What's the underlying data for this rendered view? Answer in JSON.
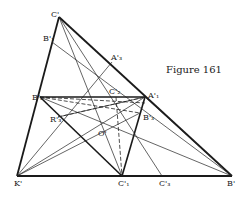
{
  "caption": "Figure 161",
  "points": {
    "C": {
      "label": "C'",
      "x": 59,
      "y": 17
    },
    "K": {
      "label": "K'",
      "x": 17,
      "y": 176
    },
    "B": {
      "label": "B'",
      "x": 232,
      "y": 176
    },
    "B2": {
      "label": "B'₂",
      "x": 40,
      "y": 97
    },
    "A1": {
      "label": "A'₁",
      "x": 145,
      "y": 97
    },
    "C1": {
      "label": "C'₁",
      "x": 122,
      "y": 176
    },
    "B1": {
      "label": "B'₁",
      "x": 52,
      "y": 42
    },
    "A3": {
      "label": "A'₃",
      "x": 112,
      "y": 62
    },
    "C2": {
      "label": "C'₂",
      "x": 116,
      "y": 97
    },
    "C3": {
      "label": "C'₃",
      "x": 162,
      "y": 176
    },
    "B3": {
      "label": "B'₃",
      "x": 140,
      "y": 113
    },
    "R3": {
      "label": "R'₃",
      "x": 58,
      "y": 117
    },
    "O": {
      "label": "O'",
      "x": 104,
      "y": 128
    }
  },
  "labels": [
    {
      "id": "C",
      "text": "C'",
      "x": 51,
      "y": 11
    },
    {
      "id": "B1",
      "text": "B'₁",
      "x": 43,
      "y": 35
    },
    {
      "id": "A3",
      "text": "A'₃",
      "x": 111,
      "y": 54
    },
    {
      "id": "B2",
      "text": "B'₂",
      "x": 32,
      "y": 94
    },
    {
      "id": "C2",
      "text": "C'₂",
      "x": 109,
      "y": 88
    },
    {
      "id": "A1",
      "text": "A'₁",
      "x": 148,
      "y": 92
    },
    {
      "id": "R3",
      "text": "R'₃",
      "x": 50,
      "y": 116
    },
    {
      "id": "B3",
      "text": "B'₃",
      "x": 143,
      "y": 114
    },
    {
      "id": "O",
      "text": "O'",
      "x": 98,
      "y": 130
    },
    {
      "id": "K",
      "text": "K'",
      "x": 14,
      "y": 180
    },
    {
      "id": "C1",
      "text": "C'₁",
      "x": 118,
      "y": 180
    },
    {
      "id": "C3",
      "text": "C'₃",
      "x": 159,
      "y": 180
    },
    {
      "id": "B",
      "text": "B'",
      "x": 227,
      "y": 180
    }
  ]
}
